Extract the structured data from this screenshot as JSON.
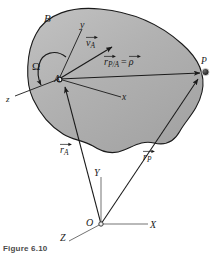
{
  "figure": {
    "caption": "Figure 6.10",
    "background_color": "#ffffff",
    "body_fill_color": "#b3b3b3",
    "body_stroke_color": "#1a1a1a",
    "line_color": "#1a1a1a"
  },
  "labels": {
    "body": "B",
    "omega": "Ω",
    "point_a": "A",
    "point_p": "P",
    "point_o": "O",
    "body_axis_x": "x",
    "body_axis_y": "y",
    "body_axis_z": "z",
    "global_axis_x": "X",
    "global_axis_y": "Y",
    "global_axis_z": "Z"
  },
  "vectors": {
    "velocity_a": {
      "symbol": "v",
      "subscript": "A"
    },
    "r_p_over_a": {
      "symbol": "r",
      "subscript": "P/A"
    },
    "rho": {
      "symbol": "ρ",
      "subscript": ""
    },
    "equals": "=",
    "r_a": {
      "symbol": "r",
      "subscript": "A"
    },
    "r_p": {
      "symbol": "r",
      "subscript": "P"
    }
  }
}
